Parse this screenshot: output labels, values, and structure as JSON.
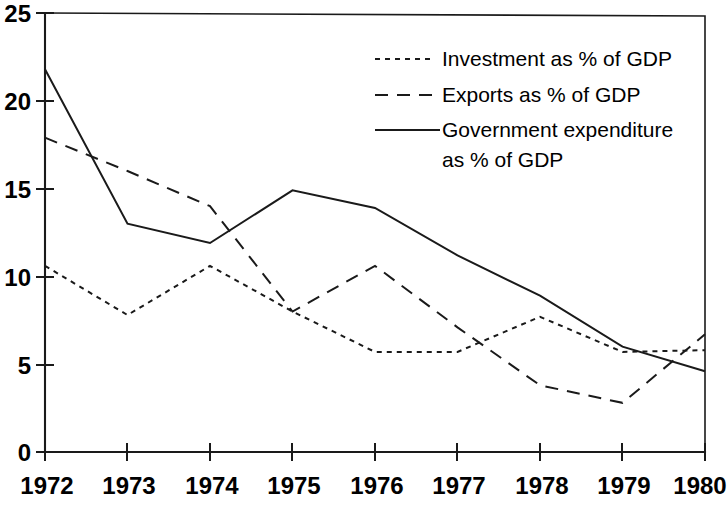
{
  "chart_data": {
    "type": "line",
    "title": "",
    "subtitle": "",
    "xlabel": "",
    "ylabel": "",
    "x": [
      1972,
      1973,
      1974,
      1975,
      1976,
      1977,
      1978,
      1979,
      1980
    ],
    "categories": [
      "1972",
      "1973",
      "1974",
      "1975",
      "1976",
      "1977",
      "1978",
      "1979",
      "1980"
    ],
    "xlim": [
      1972,
      1980
    ],
    "ylim": [
      0,
      25
    ],
    "ytick_labels": [
      "0",
      "5",
      "10",
      "15",
      "20",
      "25"
    ],
    "ytick_values": [
      0,
      5,
      10,
      15,
      20,
      25
    ],
    "xtick_labels": [
      "1972",
      "1973",
      "1974",
      "1975",
      "1976",
      "1977",
      "1978",
      "1979",
      "1980"
    ],
    "grid": false,
    "legend_position": "top-right",
    "series": [
      {
        "name": "Investment as % of GDP",
        "style": "dotted",
        "color": "#1a1a1a",
        "values": [
          10.6,
          7.8,
          10.6,
          8.0,
          5.7,
          5.7,
          7.7,
          5.7,
          5.8
        ]
      },
      {
        "name": "Exports as % of GDP",
        "style": "dashed",
        "color": "#1a1a1a",
        "values": [
          17.9,
          16.0,
          14.0,
          8.0,
          10.6,
          7.1,
          3.8,
          2.8,
          6.7
        ]
      },
      {
        "name": "Government expenditure as % of GDP",
        "style": "solid",
        "color": "#1a1a1a",
        "values": [
          21.8,
          13.0,
          11.9,
          14.9,
          13.9,
          11.2,
          8.9,
          6.0,
          4.6
        ]
      }
    ],
    "legend": [
      {
        "label": "Investment as % of GDP",
        "style": "dotted"
      },
      {
        "label": "Exports as % of GDP",
        "style": "dashed"
      },
      {
        "label": "Government expenditure",
        "style": "solid"
      },
      {
        "label": "as % of GDP",
        "style": "none"
      }
    ]
  },
  "axis": {
    "y_labels": [
      "25",
      "20",
      "15",
      "10",
      "5",
      "0"
    ],
    "x_labels": [
      "1972",
      "1973",
      "1974",
      "1975",
      "1976",
      "1977",
      "1978",
      "1979",
      "1980"
    ]
  },
  "legend": {
    "line1": "Investment as % of GDP",
    "line2": "Exports as % of GDP",
    "line3": "Government expenditure",
    "line4": "as % of GDP"
  }
}
